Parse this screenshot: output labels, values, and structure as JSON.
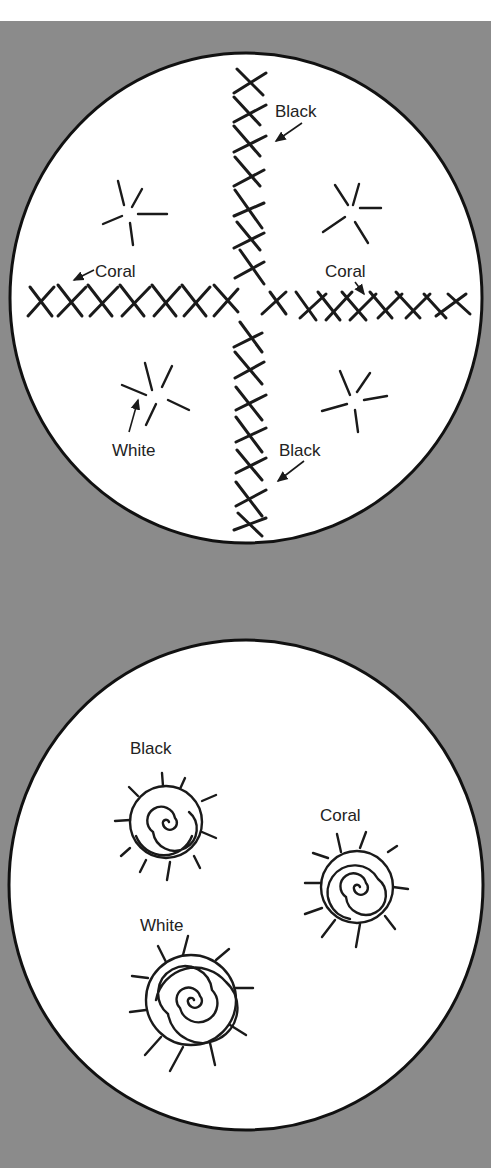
{
  "figure": {
    "background_color": "#8b8b8b",
    "circle_fill": "#ffffff",
    "line_color": "#1a1a1a"
  },
  "top_panel": {
    "title": "Cross stitch and star stitch motif",
    "labels": {
      "black_top": "Black",
      "coral_left": "Coral",
      "coral_right": "Coral",
      "white": "White",
      "black_bottom": "Black"
    }
  },
  "bottom_panel": {
    "title": "Spiral stitch motifs",
    "labels": {
      "black": "Black",
      "coral": "Coral",
      "white": "White"
    }
  }
}
